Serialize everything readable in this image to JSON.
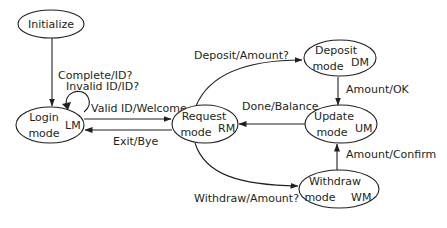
{
  "diagram": {
    "type": "state-machine",
    "colors": {
      "stroke": "#231f20",
      "background": "#ffffff"
    },
    "states": {
      "initialize": {
        "line1": "Initialize",
        "line2": "",
        "abbr": ""
      },
      "login": {
        "line1": "Login",
        "line2": "mode",
        "abbr": "LM"
      },
      "request": {
        "line1": "Request",
        "line2": "mode",
        "abbr": "RM"
      },
      "deposit": {
        "line1": "Deposit",
        "line2": "mode",
        "abbr": "DM"
      },
      "update": {
        "line1": "Update",
        "line2": "mode",
        "abbr": "UM"
      },
      "withdraw": {
        "line1": "Withdraw",
        "line2": "mode",
        "abbr": "WM"
      }
    },
    "transitions": {
      "init_to_login": {
        "from": "Initialize",
        "to": "Login mode",
        "label": "Complete/ID?"
      },
      "login_self": {
        "from": "Login mode",
        "to": "Login mode",
        "label": "Invalid ID/ID?"
      },
      "login_to_request": {
        "from": "Login mode",
        "to": "Request mode",
        "label": "Valid ID/Welcome"
      },
      "request_to_login": {
        "from": "Request mode",
        "to": "Login mode",
        "label": "Exit/Bye"
      },
      "request_to_deposit": {
        "from": "Request mode",
        "to": "Deposit mode",
        "label": "Deposit/Amount?"
      },
      "deposit_to_update": {
        "from": "Deposit mode",
        "to": "Update mode",
        "label": "Amount/OK"
      },
      "update_to_request": {
        "from": "Update mode",
        "to": "Request mode",
        "label": "Done/Balance"
      },
      "request_to_withdraw": {
        "from": "Request mode",
        "to": "Withdraw mode",
        "label": "Withdraw/Amount?"
      },
      "withdraw_to_update": {
        "from": "Withdraw mode",
        "to": "Update mode",
        "label": "Amount/Confirm"
      }
    }
  }
}
